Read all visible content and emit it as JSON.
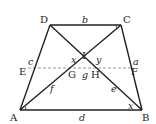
{
  "diagram": {
    "type": "trapezoid",
    "stroke_color": "#222222",
    "dashed_color": "#9a9a9a",
    "points": {
      "A": {
        "label": "A",
        "x": 20,
        "y": 110
      },
      "B": {
        "label": "B",
        "x": 142,
        "y": 110
      },
      "C": {
        "label": "C",
        "x": 121,
        "y": 25
      },
      "D": {
        "label": "D",
        "x": 50,
        "y": 25
      },
      "E": {
        "label": "E",
        "x": 28,
        "y": 68
      },
      "F": {
        "label": "F",
        "x": 131,
        "y": 68
      },
      "G": {
        "label": "G",
        "x": 76,
        "y": 68
      },
      "H": {
        "label": "H",
        "x": 96,
        "y": 68
      },
      "I": {
        "label": "I",
        "x": 84,
        "y": 57
      }
    },
    "segment_labels": {
      "DC": "b",
      "AB": "d",
      "BC": "a",
      "AD": "c",
      "GH": "g",
      "AG": "f",
      "BH": "e",
      "angle_IGH": "x",
      "angle_IHG": "y",
      "angle_ABD": "x"
    }
  }
}
